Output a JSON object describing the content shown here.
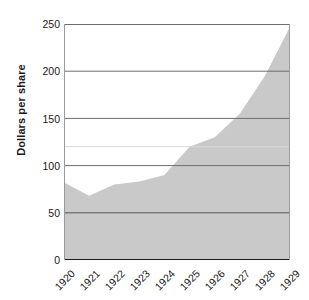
{
  "chart_data": {
    "type": "area",
    "title": "",
    "xlabel": "",
    "ylabel": "Dollars per share",
    "categories": [
      "1920",
      "1921",
      "1922",
      "1923",
      "1924",
      "1925",
      "1926",
      "1927",
      "1928",
      "1929"
    ],
    "values": [
      82,
      68,
      80,
      83,
      90,
      120,
      130,
      155,
      195,
      247
    ],
    "x": [
      1920,
      1921,
      1922,
      1923,
      1924,
      1925,
      1926,
      1927,
      1928,
      1929
    ],
    "ylim": [
      0,
      250
    ],
    "yticks": [
      0,
      50,
      100,
      150,
      200,
      250
    ],
    "ytick_labels": [
      "0",
      "50",
      "100",
      "150",
      "200",
      "250"
    ],
    "grid": true,
    "legend": false,
    "series": [
      {
        "name": "Dollars per share",
        "values": [
          82,
          68,
          80,
          83,
          90,
          120,
          130,
          155,
          195,
          247
        ]
      }
    ],
    "colors": {
      "area_fill": "#c9c9c9",
      "gridline": "#4d4d4d",
      "axis": "#1a1a1a",
      "text": "#1a1a1a",
      "background": "#ffffff"
    }
  }
}
